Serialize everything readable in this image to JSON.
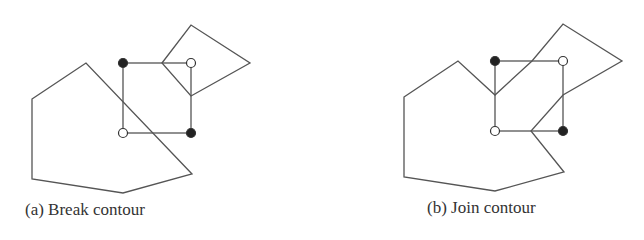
{
  "figures": [
    {
      "caption": "(a) Break contour",
      "contours": [
        [
          [
            32,
            99
          ],
          [
            86,
            63
          ],
          [
            192,
            174
          ],
          [
            123,
            193
          ],
          [
            32,
            179
          ]
        ],
        [
          [
            162,
            63
          ],
          [
            191,
            25
          ],
          [
            250,
            63
          ],
          [
            191,
            96
          ]
        ]
      ],
      "cell": {
        "x1": 123,
        "y1": 63,
        "x2": 191,
        "y2": 133
      },
      "vertices": [
        {
          "x": 123,
          "y": 63,
          "state": "filled"
        },
        {
          "x": 191,
          "y": 63,
          "state": "open"
        },
        {
          "x": 123,
          "y": 133,
          "state": "open"
        },
        {
          "x": 191,
          "y": 133,
          "state": "filled"
        }
      ]
    },
    {
      "caption": "(b) Join contour",
      "contours": [
        [
          [
            404,
            97
          ],
          [
            458,
            61
          ],
          [
            495,
            95
          ],
          [
            532,
            61
          ],
          [
            563,
            24
          ],
          [
            622,
            61
          ],
          [
            563,
            95
          ],
          [
            531,
            131
          ],
          [
            564,
            172
          ],
          [
            495,
            191
          ],
          [
            404,
            177
          ]
        ]
      ],
      "cell": {
        "x1": 495,
        "y1": 61,
        "x2": 563,
        "y2": 131
      },
      "vertices": [
        {
          "x": 495,
          "y": 61,
          "state": "filled"
        },
        {
          "x": 563,
          "y": 61,
          "state": "open"
        },
        {
          "x": 495,
          "y": 131,
          "state": "open"
        },
        {
          "x": 563,
          "y": 131,
          "state": "filled"
        }
      ]
    }
  ]
}
